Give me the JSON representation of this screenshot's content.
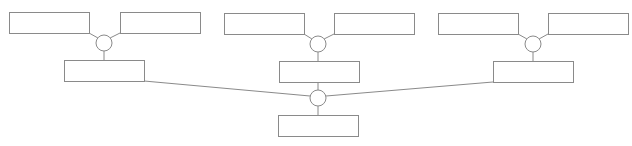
{
  "diagram": {
    "type": "tree",
    "stroke_color": "#8a8a8a",
    "background_color": "#ffffff",
    "boxes": [
      {
        "id": "left-top-a",
        "x": 9,
        "y": 12,
        "w": 80,
        "h": 21,
        "label": ""
      },
      {
        "id": "left-top-b",
        "x": 120,
        "y": 12,
        "w": 80,
        "h": 21,
        "label": ""
      },
      {
        "id": "left-mid",
        "x": 64,
        "y": 60,
        "w": 80,
        "h": 21,
        "label": ""
      },
      {
        "id": "center-top-a",
        "x": 224,
        "y": 13,
        "w": 80,
        "h": 21,
        "label": ""
      },
      {
        "id": "center-top-b",
        "x": 334,
        "y": 13,
        "w": 80,
        "h": 21,
        "label": ""
      },
      {
        "id": "center-mid",
        "x": 279,
        "y": 61,
        "w": 80,
        "h": 21,
        "label": ""
      },
      {
        "id": "right-top-a",
        "x": 438,
        "y": 13,
        "w": 80,
        "h": 21,
        "label": ""
      },
      {
        "id": "right-top-b",
        "x": 548,
        "y": 13,
        "w": 80,
        "h": 21,
        "label": ""
      },
      {
        "id": "right-mid",
        "x": 493,
        "y": 61,
        "w": 80,
        "h": 21,
        "label": ""
      },
      {
        "id": "bottom-root",
        "x": 278,
        "y": 115,
        "w": 80,
        "h": 21,
        "label": ""
      }
    ],
    "junctions": [
      {
        "id": "left-junction",
        "cx": 104,
        "cy": 43,
        "r": 8
      },
      {
        "id": "center-junction",
        "cx": 318,
        "cy": 44,
        "r": 8
      },
      {
        "id": "right-junction",
        "cx": 533,
        "cy": 44,
        "r": 8
      },
      {
        "id": "bottom-junction",
        "cx": 318,
        "cy": 98,
        "r": 8
      }
    ],
    "edges": [
      {
        "from": "left-top-a",
        "to": "left-junction"
      },
      {
        "from": "left-top-b",
        "to": "left-junction"
      },
      {
        "from": "left-junction",
        "to": "left-mid"
      },
      {
        "from": "center-top-a",
        "to": "center-junction"
      },
      {
        "from": "center-top-b",
        "to": "center-junction"
      },
      {
        "from": "center-junction",
        "to": "center-mid"
      },
      {
        "from": "right-top-a",
        "to": "right-junction"
      },
      {
        "from": "right-top-b",
        "to": "right-junction"
      },
      {
        "from": "right-junction",
        "to": "right-mid"
      },
      {
        "from": "left-mid",
        "to": "bottom-junction"
      },
      {
        "from": "center-mid",
        "to": "bottom-junction"
      },
      {
        "from": "right-mid",
        "to": "bottom-junction"
      },
      {
        "from": "bottom-junction",
        "to": "bottom-root"
      }
    ]
  }
}
